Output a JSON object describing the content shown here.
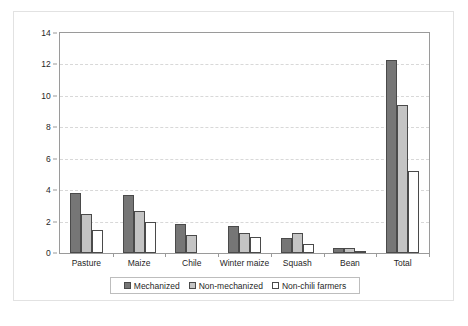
{
  "chart_data": {
    "type": "bar",
    "title": "",
    "xlabel": "",
    "ylabel": "Hectares in crop",
    "ylim": [
      0,
      14
    ],
    "yticks": [
      0,
      2,
      4,
      6,
      8,
      10,
      12,
      14
    ],
    "grid": true,
    "legend_position": "bottom",
    "categories": [
      "Pasture",
      "Maize",
      "Chile",
      "Winter maize",
      "Squash",
      "Bean",
      "Total"
    ],
    "series": [
      {
        "name": "Mechanized",
        "color": "#767676",
        "values": [
          3.8,
          3.7,
          1.85,
          1.75,
          0.95,
          0.35,
          12.3
        ]
      },
      {
        "name": "Non-mechanized",
        "color": "#c4c4c4",
        "values": [
          2.5,
          2.7,
          1.15,
          1.25,
          1.3,
          0.3,
          9.4
        ]
      },
      {
        "name": "Non-chili farmers",
        "color": "#ffffff",
        "values": [
          1.45,
          1.95,
          0,
          1.05,
          0.55,
          0.15,
          5.2
        ]
      }
    ]
  },
  "axes": {
    "y_title": "Hectares in crop",
    "y_tick_labels": [
      "0",
      "2",
      "4",
      "6",
      "8",
      "10",
      "12",
      "14"
    ],
    "x_tick_labels": [
      "Pasture",
      "Maize",
      "Chile",
      "Winter maize",
      "Squash",
      "Bean",
      "Total"
    ]
  },
  "legend": {
    "items": [
      {
        "label": "Mechanized",
        "swatch": "mech"
      },
      {
        "label": "Non-mechanized",
        "swatch": "nonmech"
      },
      {
        "label": "Non-chili farmers",
        "swatch": "nonchili"
      }
    ]
  },
  "caption": {
    "text": ""
  },
  "colors": {
    "mechanized": "#767676",
    "non_mechanized": "#c4c4c4",
    "non_chili_farmers": "#ffffff",
    "bar_outline": "#4a4a4a",
    "axis": "#9a9a9a",
    "gridline": "#d8d8d8",
    "figure_border": "#e2e2e2"
  }
}
